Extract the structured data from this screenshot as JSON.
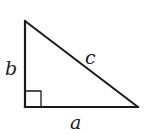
{
  "diagram": {
    "type": "right-triangle",
    "stroke_color": "#1a1a1a",
    "background": "#ffffff",
    "vertices": {
      "top": [
        25,
        21
      ],
      "right_angle": [
        25,
        107
      ],
      "right": [
        138,
        107
      ]
    },
    "right_angle_marker": {
      "size": 16
    },
    "labels": {
      "a": "a",
      "b": "b",
      "c": "c"
    }
  }
}
